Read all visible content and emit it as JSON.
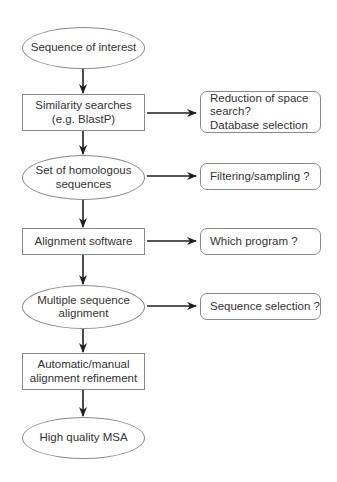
{
  "flowchart": {
    "main_steps": [
      {
        "label": "Sequence of interest",
        "shape": "ellipse"
      },
      {
        "label": "Similarity searches\n(e.g. BlastP)",
        "shape": "rectangle"
      },
      {
        "label": "Set of homologous\nsequences",
        "shape": "ellipse"
      },
      {
        "label": "Alignment software",
        "shape": "rectangle"
      },
      {
        "label": "Multiple sequence\nalignment",
        "shape": "ellipse"
      },
      {
        "label": "Automatic/manual\nalignment refinement",
        "shape": "rectangle"
      },
      {
        "label": "High quality MSA",
        "shape": "ellipse"
      }
    ],
    "side_notes": [
      {
        "label": "Reduction of space\nsearch?\nDatabase selection",
        "attached_to_step": 1
      },
      {
        "label": "Filtering/sampling ?",
        "attached_to_step": 2
      },
      {
        "label": "Which program ?",
        "attached_to_step": 3
      },
      {
        "label": "Sequence selection ?",
        "attached_to_step": 4
      }
    ],
    "colors": {
      "outline": "#8a8a8a",
      "arrow": "#1e1e1e",
      "text": "#333333",
      "background": "#ffffff"
    }
  }
}
